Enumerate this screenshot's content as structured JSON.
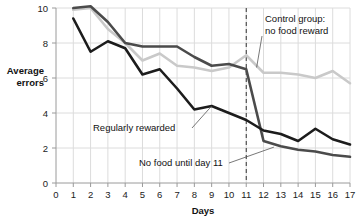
{
  "chart_data": {
    "type": "line",
    "title": "",
    "xlabel": "Days",
    "ylabel": "Average errors",
    "xlim": [
      0,
      17
    ],
    "ylim": [
      0,
      10
    ],
    "xticks": [
      0,
      1,
      2,
      3,
      4,
      5,
      6,
      7,
      8,
      9,
      10,
      11,
      12,
      13,
      14,
      15,
      16,
      17
    ],
    "yticks": [
      0,
      2,
      4,
      6,
      8,
      10
    ],
    "grid": true,
    "legend_position": "inline-annotations",
    "x": [
      1,
      2,
      3,
      4,
      5,
      6,
      7,
      8,
      9,
      10,
      11,
      12,
      13,
      14,
      15,
      16,
      17
    ],
    "series": [
      {
        "name": "Control group: no food reward",
        "color": "#c9c9c9",
        "values": [
          9.9,
          10.0,
          8.8,
          8.0,
          7.0,
          7.4,
          6.7,
          6.6,
          6.4,
          6.6,
          7.3,
          6.3,
          6.3,
          6.2,
          6.0,
          6.4,
          5.7
        ]
      },
      {
        "name": "No food until day 11",
        "color": "#4b4b4b",
        "values": [
          10.0,
          10.1,
          9.2,
          8.0,
          7.8,
          7.8,
          7.8,
          7.2,
          6.7,
          6.8,
          6.5,
          2.4,
          2.1,
          1.9,
          1.8,
          1.6,
          1.5
        ]
      },
      {
        "name": "Regularly rewarded",
        "color": "#1c1c1c",
        "values": [
          9.4,
          7.5,
          8.1,
          7.7,
          6.2,
          6.5,
          5.4,
          4.2,
          4.4,
          4.0,
          3.6,
          3.0,
          2.8,
          2.4,
          3.1,
          2.5,
          2.2
        ]
      }
    ],
    "annotations": [
      {
        "id": "control-group",
        "text_line1": "Control group:",
        "text_line2": "no food reward",
        "target_day": 11.6,
        "target_value": 6.6
      },
      {
        "id": "regularly-rewarded",
        "text": "Regularly rewarded",
        "target_day": 9.0,
        "target_value": 4.4
      },
      {
        "id": "no-food-until-day-11",
        "text": "No food until day 11",
        "target_day": 12.6,
        "target_value": 2.05
      }
    ],
    "reference_line": {
      "id": "day-11-marker",
      "axis": "x",
      "value": 11,
      "style": "dashed",
      "color": "#333333"
    }
  }
}
